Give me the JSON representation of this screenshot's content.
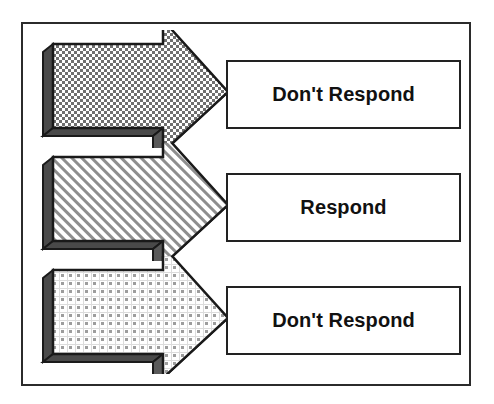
{
  "diagram": {
    "frame": {
      "border_color": "#2b2b2b",
      "background": "#ffffff"
    },
    "rows": [
      {
        "id": "row-0",
        "arrow": {
          "name": "arrow-1",
          "direction": "right",
          "fill_pattern": "dense-checkerboard",
          "fill_color": "#8a8a8a",
          "outline_color": "#1a1a1a",
          "shadow_color": "#3a3a3a"
        },
        "box": {
          "name": "outcome-box-1",
          "label": "Don't Respond",
          "border_color": "#222222",
          "background": "#ffffff"
        }
      },
      {
        "id": "row-1",
        "arrow": {
          "name": "arrow-2",
          "direction": "right",
          "fill_pattern": "diagonal-hatch",
          "fill_color": "#9a9a9a",
          "outline_color": "#1a1a1a",
          "shadow_color": "#3a3a3a"
        },
        "box": {
          "name": "outcome-box-2",
          "label": "Respond",
          "border_color": "#222222",
          "background": "#ffffff"
        }
      },
      {
        "id": "row-2",
        "arrow": {
          "name": "arrow-3",
          "direction": "right",
          "fill_pattern": "sparse-dot-grid",
          "fill_color": "#c9c9c9",
          "outline_color": "#1a1a1a",
          "shadow_color": "#3a3a3a"
        },
        "box": {
          "name": "outcome-box-3",
          "label": "Don't Respond",
          "border_color": "#222222",
          "background": "#ffffff"
        }
      }
    ]
  }
}
